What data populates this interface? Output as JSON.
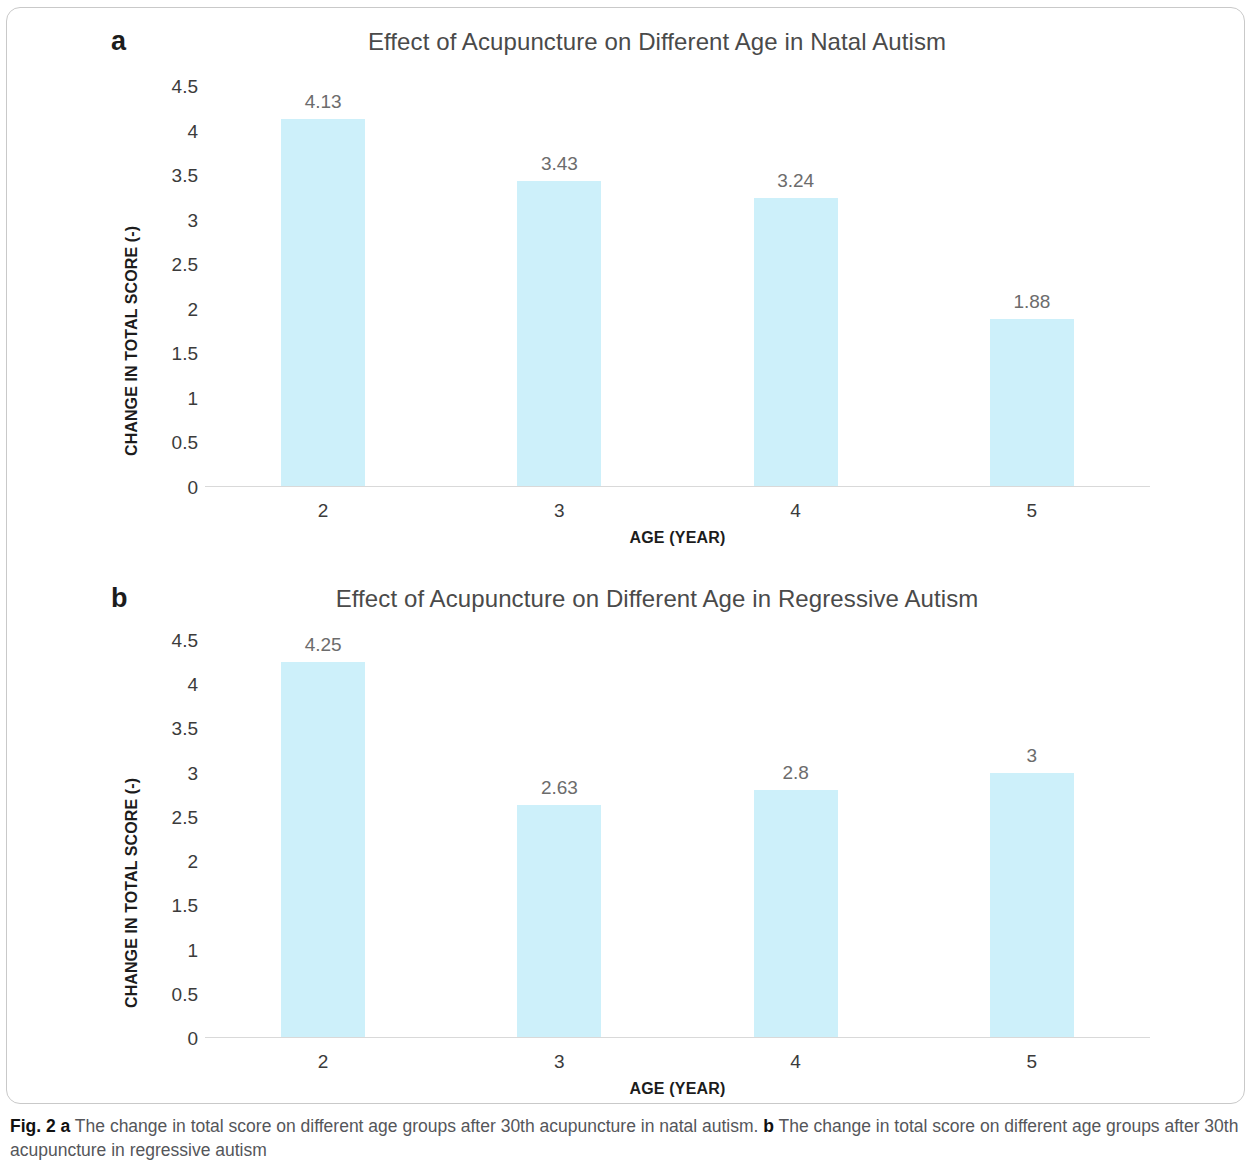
{
  "figure": {
    "caption_prefix": "Fig. 2",
    "caption_a_letter": "a",
    "caption_a_text": "The change in total score on different age groups after 30th acupuncture in natal autism.",
    "caption_b_letter": "b",
    "caption_b_text": "The change in total score on different age groups after 30th acupuncture in regressive autism",
    "bar_color": "#cdf0fa",
    "axis_color": "#d9d9d9",
    "frame_color": "#c9c9c9"
  },
  "panels": [
    {
      "letter": "a",
      "title": "Effect of Acupuncture on Different Age in Natal Autism"
    },
    {
      "letter": "b",
      "title": "Effect of Acupuncture on Different Age in Regressive Autism"
    }
  ],
  "chart_data": [
    {
      "type": "bar",
      "panel": "a",
      "title": "Effect of Acupuncture on Different Age in Natal Autism",
      "xlabel": "AGE (YEAR)",
      "ylabel": "CHANGE IN TOTAL SCORE (-)",
      "categories": [
        "2",
        "3",
        "4",
        "5"
      ],
      "values": [
        4.13,
        3.43,
        3.24,
        1.88
      ],
      "value_labels": [
        "4.13",
        "3.43",
        "3.24",
        "1.88"
      ],
      "ylim": [
        0,
        4.5
      ],
      "yticks": [
        0,
        0.5,
        1,
        1.5,
        2,
        2.5,
        3,
        3.5,
        4,
        4.5
      ],
      "ytick_labels": [
        "0",
        "0.5",
        "1",
        "1.5",
        "2",
        "2.5",
        "3",
        "3.5",
        "4",
        "4.5"
      ],
      "grid": false,
      "legend": null,
      "bar_color": "#cdf0fa"
    },
    {
      "type": "bar",
      "panel": "b",
      "title": "Effect of Acupuncture on Different Age in Regressive Autism",
      "xlabel": "AGE (YEAR)",
      "ylabel": "CHANGE IN TOTAL SCORE (-)",
      "categories": [
        "2",
        "3",
        "4",
        "5"
      ],
      "values": [
        4.25,
        2.63,
        2.8,
        3
      ],
      "value_labels": [
        "4.25",
        "2.63",
        "2.8",
        "3"
      ],
      "ylim": [
        0,
        4.5
      ],
      "yticks": [
        0,
        0.5,
        1,
        1.5,
        2,
        2.5,
        3,
        3.5,
        4,
        4.5
      ],
      "ytick_labels": [
        "0",
        "0.5",
        "1",
        "1.5",
        "2",
        "2.5",
        "3",
        "3.5",
        "4",
        "4.5"
      ],
      "grid": false,
      "legend": null,
      "bar_color": "#cdf0fa"
    }
  ]
}
